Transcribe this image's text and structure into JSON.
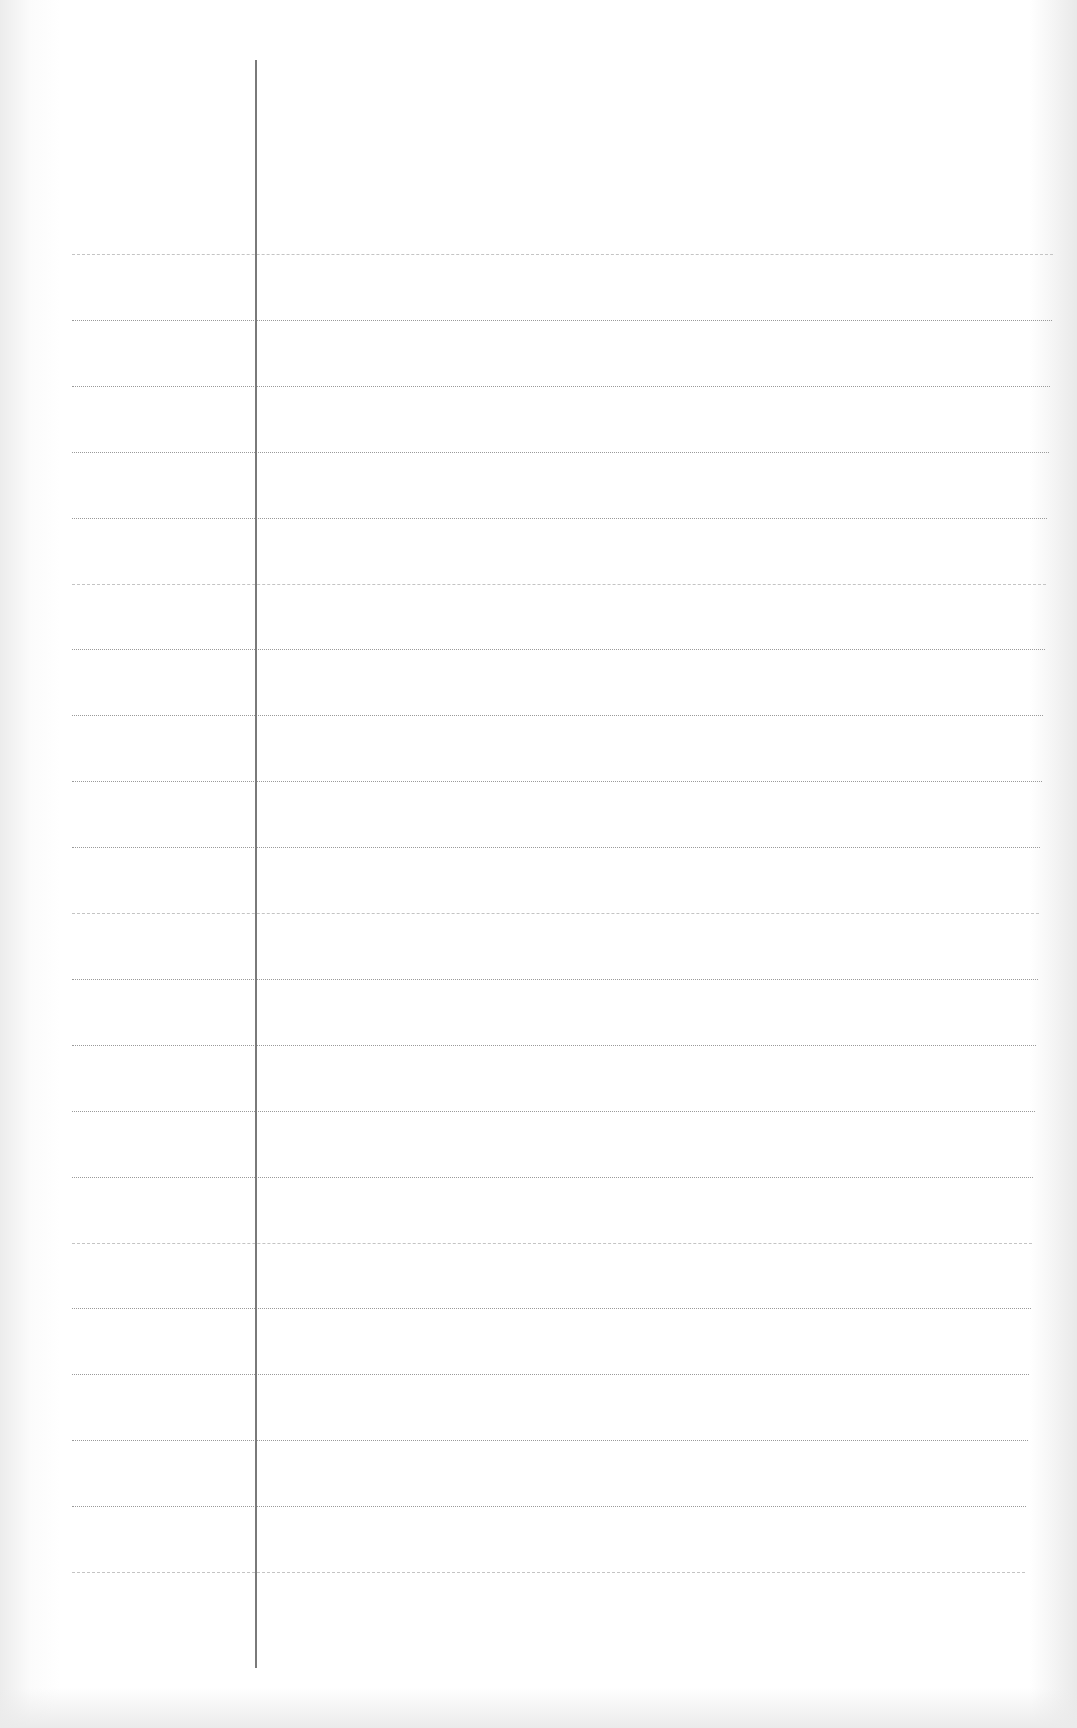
{
  "page": {
    "type": "blank ruled notebook page",
    "background_color": "#ffffff",
    "rule_color": "#9a9a9a",
    "margin_line_color": "#7a7a7a",
    "margin_line": {
      "x": 255,
      "top": 60,
      "bottom": 1668
    },
    "rules": {
      "count": 21,
      "first_y": 254,
      "spacing": 65.9,
      "left_x": 72,
      "right_x_top": 1053,
      "right_x_bottom": 1025
    },
    "text": []
  }
}
